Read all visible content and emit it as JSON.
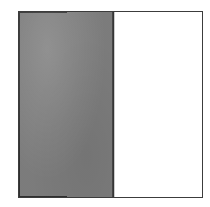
{
  "figure": {
    "kind": "proportion-rectangle",
    "canvas": {
      "width": 210,
      "height": 207,
      "background_color": "#ffffff"
    },
    "frame": {
      "left": 18,
      "top": 11,
      "width": 185,
      "height": 187,
      "border_color": "#3c3c3c",
      "border_width": 1.5,
      "fill_color": "#ffffff"
    },
    "divider": {
      "orientation": "vertical",
      "position_percent": 51.4,
      "color": "#353535",
      "width": 1.5
    },
    "regions": [
      {
        "name": "shaded",
        "label": "",
        "fill": "halftone-gray",
        "fill_color": "#a9a9a9",
        "width_percent": 51.4,
        "texture": "fine-dither-stipple"
      },
      {
        "name": "unshaded",
        "label": "",
        "fill": "solid-white",
        "fill_color": "#ffffff",
        "width_percent": 48.6,
        "texture": "none"
      }
    ],
    "text_content": []
  },
  "chart_data": {
    "type": "bar",
    "title": "",
    "subtitle": "",
    "xlabel": "",
    "ylabel": "",
    "orientation": "horizontal",
    "grid": false,
    "legend": null,
    "categories": [
      "shaded",
      "unshaded"
    ],
    "values": [
      51.4,
      48.6
    ],
    "value_unit": "percent of total width",
    "xlim": [
      0,
      100
    ],
    "tick_labels": [],
    "annotations": [],
    "colors": [
      "#a9a9a9",
      "#ffffff"
    ]
  }
}
